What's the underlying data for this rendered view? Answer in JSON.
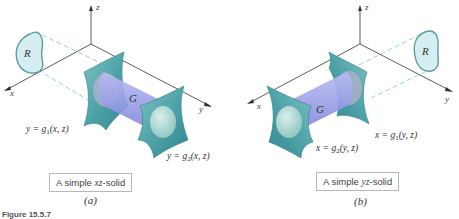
{
  "figure": {
    "label": "Figure 15.5.7",
    "colors": {
      "surface_teal": "#4fa3a8",
      "surface_light": "#a9d6d4",
      "solid_purple": "#9a9ee6",
      "region_fill": "#d5eef2",
      "region_stroke": "#5c9aa6",
      "projection_dash": "#9ccfd6",
      "axis": "#333333"
    }
  },
  "panels": [
    {
      "id": "a",
      "sublabel": "(a)",
      "caption_prefix": "A simple ",
      "caption_var": "xz",
      "caption_suffix": "-solid",
      "axes": {
        "x": "x",
        "y": "y",
        "z": "z"
      },
      "region_label": "R",
      "solid_label": "G",
      "lower_surface": {
        "lhs": "y = g",
        "sub": "1",
        "args": "(x, z)"
      },
      "upper_surface": {
        "lhs": "y = g",
        "sub": "2",
        "args": "(x, z)"
      }
    },
    {
      "id": "b",
      "sublabel": "(b)",
      "caption_prefix": "A simple ",
      "caption_var": "yz",
      "caption_suffix": "-solid",
      "axes": {
        "x": "x",
        "y": "y",
        "z": "z"
      },
      "region_label": "R",
      "solid_label": "G",
      "lower_surface": {
        "lhs": "x = g",
        "sub": "1",
        "args": "(y, z)"
      },
      "upper_surface": {
        "lhs": "x = g",
        "sub": "2",
        "args": "(y, z)"
      }
    }
  ]
}
